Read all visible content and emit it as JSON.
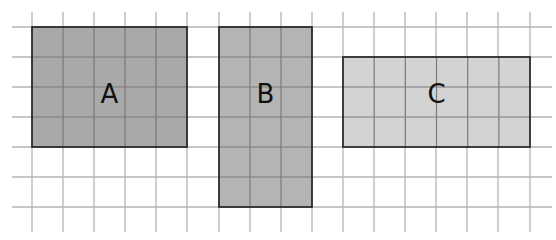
{
  "grid": {
    "cell_size": 31,
    "color": "#b4b4b4",
    "v_lines_x": [
      32,
      63,
      94,
      125,
      156,
      187,
      219,
      250,
      281,
      312,
      343,
      374,
      405,
      436,
      467,
      498,
      530
    ],
    "h_lines_y": [
      27,
      57,
      87,
      117,
      147,
      177,
      207
    ],
    "v_extent": [
      12,
      232
    ],
    "h_extent": [
      12,
      552
    ]
  },
  "shapes": [
    {
      "id": "A",
      "label": "A",
      "x": 32,
      "y": 27,
      "w": 155,
      "h": 120,
      "cols": 5,
      "rows": 4,
      "fill": "#a9a9a9"
    },
    {
      "id": "B",
      "label": "B",
      "x": 219,
      "y": 27,
      "w": 93,
      "h": 180,
      "cols": 3,
      "rows": 6,
      "fill": "#b4b4b4"
    },
    {
      "id": "C",
      "label": "C",
      "x": 343,
      "y": 57,
      "w": 187,
      "h": 90,
      "cols": 6,
      "rows": 3,
      "fill": "#d3d3d3"
    }
  ]
}
